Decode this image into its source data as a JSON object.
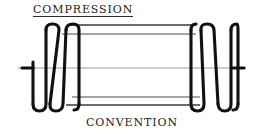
{
  "figure": {
    "kind": "engineering-drawing",
    "title": "COMPRESSION",
    "caption": "CONVENTION",
    "colors": {
      "background": "#ffffff",
      "outline": "#111111",
      "centerline": "#9a9a9a",
      "connector": "#3a3a3a",
      "text": "#1a1a1a"
    }
  },
  "geometry": {
    "center_axis": {
      "y": 68,
      "x_start": 18,
      "x_end": 246
    },
    "coil_top_y": 26,
    "coil_bottom_y": 110,
    "left_group": {
      "x_start": 30,
      "x_end": 79,
      "stub_x_start": 18,
      "stub_x_end": 34
    },
    "right_group": {
      "x_start": 190,
      "x_end": 238,
      "stub_x_start": 232,
      "stub_x_end": 246
    },
    "connector_lines": [
      {
        "name": "top-outer",
        "y": 25,
        "x1": 68,
        "x2": 196
      },
      {
        "name": "top-inner",
        "y": 34,
        "x1": 62,
        "x2": 196
      },
      {
        "name": "bottom-inner",
        "y": 97,
        "x1": 72,
        "x2": 200
      },
      {
        "name": "bottom-outer",
        "y": 105,
        "x1": 66,
        "x2": 200
      }
    ]
  }
}
